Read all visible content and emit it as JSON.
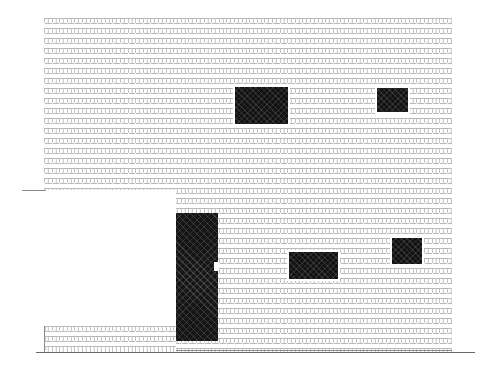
{
  "drawing": {
    "title": "Brick building elevation",
    "subject": "masonry-wall-elevation",
    "canvas": {
      "width": 496,
      "height": 384,
      "background": "#ffffff"
    },
    "line_color": "#8d8d8d",
    "mortar_color": "#b9b9b9",
    "brick_face_color": "#ffffff",
    "opening_fill_color": "#121212",
    "brick_module": {
      "width_px": 7.6,
      "height_px": 5,
      "bond": "running bond"
    }
  },
  "elements": {
    "main_wall": {
      "name": "Main brick wall",
      "x": 44,
      "y": 18,
      "width": 408,
      "height": 334
    },
    "setback_cut": {
      "name": "Left setback recess",
      "x": 44,
      "y": 190,
      "width": 132,
      "height": 136
    },
    "low_wall": {
      "name": "Low forecourt brick wall",
      "x": 44,
      "y": 326,
      "width": 132,
      "height": 24
    },
    "ground_line": {
      "name": "Ground line",
      "x": 36,
      "y": 352,
      "width": 439,
      "height": 1
    },
    "setback_top_line": {
      "name": "Setback soffit line",
      "x": 22,
      "y": 190,
      "width": 24,
      "height": 1
    },
    "low_wall_end_line": {
      "name": "Low wall return line",
      "x": 44,
      "y": 326,
      "width": 1,
      "height": 26
    },
    "wall_base_line": {
      "name": "Main wall base line",
      "x": 176,
      "y": 350,
      "width": 276,
      "height": 1
    }
  },
  "openings": [
    {
      "id": "window-upper-center",
      "label": "Upper centre window",
      "x": 235,
      "y": 87,
      "width": 53,
      "height": 37
    },
    {
      "id": "window-upper-right",
      "label": "Upper right window",
      "x": 377,
      "y": 88,
      "width": 31,
      "height": 24
    },
    {
      "id": "window-lower-center",
      "label": "Lower centre window",
      "x": 289,
      "y": 252,
      "width": 49,
      "height": 27
    },
    {
      "id": "window-lower-right",
      "label": "Lower right window",
      "x": 392,
      "y": 238,
      "width": 30,
      "height": 26
    },
    {
      "id": "door-main",
      "label": "Main tall door opening",
      "x": 176,
      "y": 213,
      "width": 42,
      "height": 128
    }
  ],
  "door_notch": {
    "name": "Door jamb notch",
    "x": 214,
    "y": 262,
    "width": 5,
    "height": 9
  }
}
